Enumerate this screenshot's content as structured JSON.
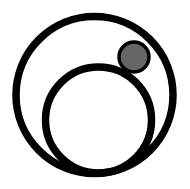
{
  "logo": {
    "name": "concentric-circles-logo",
    "colors": {
      "background": "#ffffff",
      "stroke": "#000000",
      "dot_fill": "#656565"
    },
    "outer_circle": {
      "cx": 94.5,
      "cy": 95,
      "r": 78.5,
      "stroke_width": 7.5
    },
    "inner_circle": {
      "cx": 98.5,
      "cy": 120,
      "r": 53,
      "stroke_width": 7.5
    },
    "dot": {
      "cx": 134,
      "cy": 57,
      "r": 15,
      "stroke_width": 3.5
    }
  }
}
